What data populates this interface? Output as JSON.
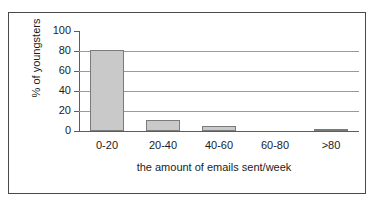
{
  "figure": {
    "clipped_top_text": "",
    "background_color": "#ffffff",
    "frame_color": "#4a4a4a"
  },
  "chart_data": {
    "type": "bar",
    "title": "",
    "subtitle": "",
    "xlabel": "the amount of emails sent/week",
    "ylabel": "% of youngsters",
    "categories": [
      "0-20",
      "20-40",
      "40-60",
      "60-80",
      ">80"
    ],
    "values": [
      81,
      11,
      5,
      0,
      2
    ],
    "series": [
      {
        "name": "% of youngsters",
        "values": [
          81,
          11,
          5,
          0,
          2
        ]
      }
    ],
    "ylim": [
      0,
      100
    ],
    "y_ticks": [
      0,
      20,
      40,
      60,
      80,
      100
    ],
    "y_tick_labels": [
      "0",
      "20",
      "40",
      "60",
      "80",
      "100"
    ],
    "grid": true,
    "grid_axis": "y",
    "legend": false,
    "legend_position": "none",
    "bar_fill_color": "#c9c9c9",
    "bar_border_color": "#7b7b7b",
    "gridline_color": "#9a9a9a",
    "axis_color": "#5d5d5d",
    "text_color": "#1c1c1c"
  }
}
